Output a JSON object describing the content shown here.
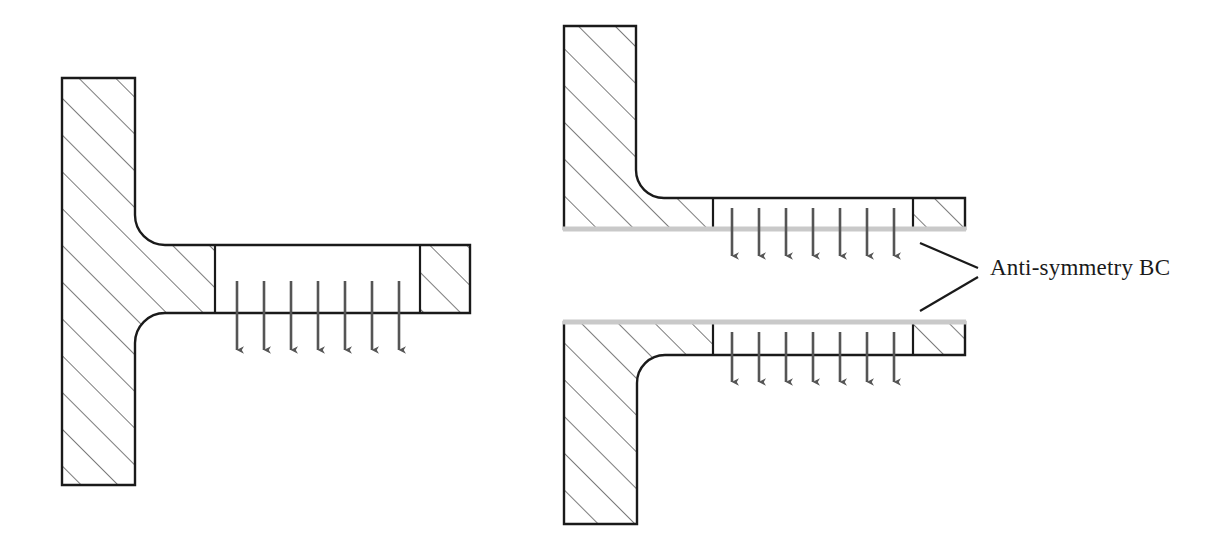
{
  "figure": {
    "background_color": "#ffffff",
    "outline_color": "#1a1a1a",
    "hatch_color": "#5a5a5a",
    "arrow_color": "#555555",
    "boundary_line_color": "#c9c9c9"
  },
  "annotations": [
    {
      "id": "anti-symmetry-bc",
      "text": "Anti-symmetry BC",
      "x": 990,
      "y": 272,
      "font_size": 23,
      "leader_lines": [
        {
          "x1": 920,
          "y1": 243,
          "x2": 978,
          "y2": 268
        },
        {
          "x1": 920,
          "y1": 311,
          "x2": 978,
          "y2": 277
        }
      ]
    }
  ],
  "models": [
    {
      "id": "full-model",
      "name": "full-t-section-model",
      "description": "Complete T-shaped cross-section with vertical web and horizontal flange",
      "column": {
        "x": 62,
        "y": 78,
        "width": 73,
        "height": 407
      },
      "arm": {
        "x": 135,
        "y": 245,
        "right": 470,
        "bottom": 313
      },
      "fillet_radius": 30,
      "hatched_regions": [
        {
          "id": "column",
          "x": 62,
          "y": 78,
          "width": 73,
          "height": 407
        },
        {
          "id": "arm-root",
          "x": 135,
          "y": 245,
          "width": 80,
          "height": 68
        },
        {
          "id": "arm-tip",
          "x": 420,
          "y": 245,
          "width": 50,
          "height": 68
        }
      ],
      "dividers": [
        {
          "x": 215,
          "y1": 245,
          "y2": 313
        },
        {
          "x": 420,
          "y1": 245,
          "y2": 313
        }
      ],
      "load": {
        "id": "distributed-load-full",
        "arrow_count": 7,
        "x_start": 237,
        "x_spacing": 27,
        "y_start": 281,
        "y_end": 350,
        "direction": "down"
      },
      "boundary_line": null
    },
    {
      "id": "half-model-upper",
      "name": "upper-half-model",
      "description": "Upper half L-shaped model cut along the anti-symmetry plane",
      "column": {
        "x": 564,
        "y": 26,
        "width": 72,
        "height": 203
      },
      "arm": {
        "x": 636,
        "y": 198,
        "right": 965,
        "bottom": 229
      },
      "fillet_radius": 28,
      "hatched_regions": [
        {
          "id": "column",
          "x": 564,
          "y": 26,
          "width": 72,
          "height": 203
        },
        {
          "id": "arm-root",
          "x": 636,
          "y": 198,
          "width": 77,
          "height": 31
        },
        {
          "id": "arm-tip",
          "x": 913,
          "y": 198,
          "width": 52,
          "height": 31
        }
      ],
      "dividers": [
        {
          "x": 713,
          "y1": 198,
          "y2": 229
        },
        {
          "x": 913,
          "y1": 198,
          "y2": 229
        }
      ],
      "load": {
        "id": "distributed-load-upper",
        "arrow_count": 7,
        "x_start": 732,
        "x_spacing": 27,
        "y_start": 208,
        "y_end": 256,
        "direction": "down"
      },
      "boundary_line": {
        "id": "anti-symmetry-plane-upper",
        "x1": 564,
        "x2": 965,
        "y": 229,
        "position": "bottom"
      }
    },
    {
      "id": "half-model-lower",
      "name": "lower-half-model",
      "description": "Lower half mirrored model cut along the anti-symmetry plane",
      "column": {
        "x": 564,
        "y": 322,
        "width": 73,
        "height": 202
      },
      "arm": {
        "x": 637,
        "y": 322,
        "right": 965,
        "bottom": 355
      },
      "fillet_radius": 28,
      "hatched_regions": [
        {
          "id": "column",
          "x": 564,
          "y": 322,
          "width": 73,
          "height": 202
        },
        {
          "id": "arm-root",
          "x": 637,
          "y": 322,
          "width": 76,
          "height": 33
        },
        {
          "id": "arm-tip",
          "x": 913,
          "y": 322,
          "width": 52,
          "height": 33
        }
      ],
      "dividers": [
        {
          "x": 713,
          "y1": 322,
          "y2": 355
        },
        {
          "x": 913,
          "y1": 322,
          "y2": 355
        }
      ],
      "load": {
        "id": "distributed-load-lower",
        "arrow_count": 7,
        "x_start": 732,
        "x_spacing": 27,
        "y_start": 332,
        "y_end": 382,
        "direction": "down"
      },
      "boundary_line": {
        "id": "anti-symmetry-plane-lower",
        "x1": 564,
        "x2": 965,
        "y": 322,
        "position": "top"
      }
    }
  ]
}
